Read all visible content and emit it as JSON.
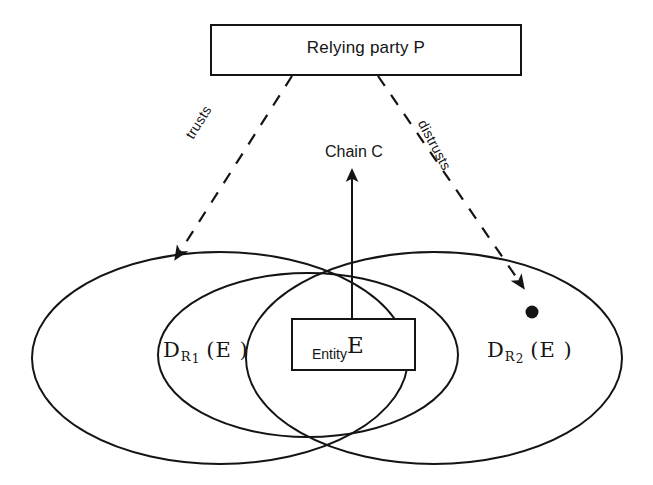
{
  "figure": {
    "type": "trust-domain-venn-diagram",
    "background_color": "#ffffff",
    "stroke_color": "#141414"
  },
  "nodes": {
    "relying_party": {
      "label": "Relying party P",
      "shape": "rectangle",
      "x": 211,
      "y": 25,
      "width": 310,
      "height": 50
    },
    "entity": {
      "label": "Entity",
      "superscript": "E",
      "shape": "rectangle",
      "x": 292,
      "y": 319,
      "width": 123,
      "height": 51
    },
    "distrusted_point": {
      "label": "",
      "shape": "filled-dot",
      "x": 532,
      "y": 312,
      "radius": 6
    }
  },
  "sets": [
    {
      "name": "left-domain-ellipse",
      "label_text": "D",
      "label_sub": "R",
      "label_subnum": "1",
      "label_arg": "(E )",
      "cx": 220,
      "cy": 358,
      "rx": 188,
      "ry": 106
    },
    {
      "name": "inner-domain-ellipse",
      "label_text": "",
      "cx": 308,
      "cy": 355,
      "rx": 150,
      "ry": 82
    },
    {
      "name": "right-domain-ellipse",
      "label_text": "D",
      "label_sub": "R",
      "label_subnum": "2",
      "label_arg": "(E )",
      "cx": 434,
      "cy": 358,
      "rx": 188,
      "ry": 106
    }
  ],
  "edges": [
    {
      "name": "trusts-edge",
      "label": "trusts",
      "style": "dashed",
      "from": "relying-party-box",
      "to": "left-domain-ellipse",
      "arrowhead": true
    },
    {
      "name": "distrusts-edge",
      "label": "distrusts",
      "style": "dashed",
      "from": "relying-party-box",
      "to": "distrusted-point",
      "arrowhead": true
    },
    {
      "name": "chain-edge",
      "label": "Chain C",
      "style": "solid",
      "from": "entity-box",
      "to": "chain-c-label",
      "arrowhead": true
    }
  ]
}
